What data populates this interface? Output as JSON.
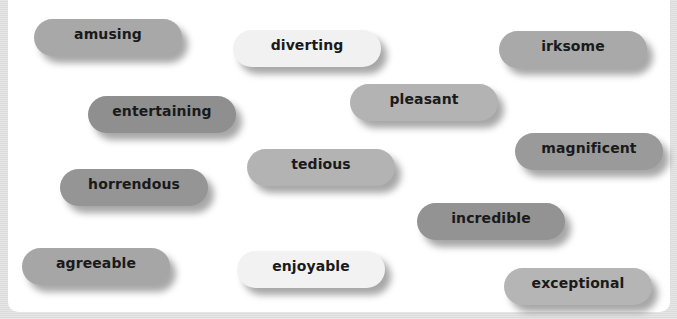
{
  "words": [
    {
      "text": "amusing",
      "x": 34,
      "y": 19,
      "color": "#a8a8a8"
    },
    {
      "text": "diverting",
      "x": 233,
      "y": 30,
      "color": "#f1f1f1"
    },
    {
      "text": "irksome",
      "x": 499,
      "y": 31,
      "color": "#a9a9a9"
    },
    {
      "text": "entertaining",
      "x": 88,
      "y": 96,
      "color": "#8f8f8f"
    },
    {
      "text": "pleasant",
      "x": 350,
      "y": 84,
      "color": "#b3b3b3"
    },
    {
      "text": "magnificent",
      "x": 515,
      "y": 133,
      "color": "#9a9a9a"
    },
    {
      "text": "tedious",
      "x": 247,
      "y": 149,
      "color": "#b3b3b3"
    },
    {
      "text": "horrendous",
      "x": 60,
      "y": 169,
      "color": "#959595"
    },
    {
      "text": "incredible",
      "x": 417,
      "y": 203,
      "color": "#939393"
    },
    {
      "text": "agreeable",
      "x": 22,
      "y": 248,
      "color": "#a6a6a6"
    },
    {
      "text": "enjoyable",
      "x": 237,
      "y": 251,
      "color": "#f2f2f2"
    },
    {
      "text": "exceptional",
      "x": 504,
      "y": 268,
      "color": "#b5b5b5"
    }
  ]
}
